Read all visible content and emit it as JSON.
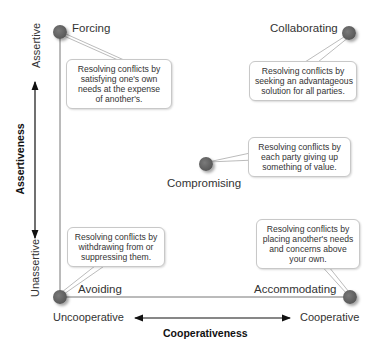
{
  "diagram": {
    "y_axis": {
      "title": "Assertiveness",
      "high": "Assertive",
      "low": "Unassertive"
    },
    "x_axis": {
      "title": "Cooperativeness",
      "low": "Uncooperative",
      "high": "Cooperative"
    },
    "styles": [
      {
        "name": "Forcing",
        "lines": [
          "Resolving conflicts by",
          "satisfying one's own",
          "needs at the expense",
          "of another's."
        ]
      },
      {
        "name": "Collaborating",
        "lines": [
          "Resolving conflicts by",
          "seeking an advantageous",
          "solution for all parties."
        ]
      },
      {
        "name": "Compromising",
        "lines": [
          "Resolving conflicts by",
          "each party giving up",
          "something of value."
        ]
      },
      {
        "name": "Avoiding",
        "lines": [
          "Resolving conflicts by",
          "withdrawing from or",
          "suppressing them."
        ]
      },
      {
        "name": "Accommodating",
        "lines": [
          "Resolving conflicts by",
          "placing another's needs",
          "and concerns above",
          "your own."
        ]
      }
    ]
  }
}
